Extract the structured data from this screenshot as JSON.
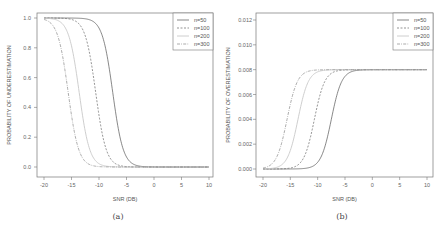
{
  "chart_data": [
    {
      "id": "a",
      "type": "line",
      "caption": "(a)",
      "title": "",
      "xlabel": "SNR (DB)",
      "ylabel": "PROBABILITY OF UNDERESTIMATION",
      "xlim": [
        -20,
        10
      ],
      "ylim": [
        0,
        1
      ],
      "xticks": [
        -20,
        -15,
        -10,
        -5,
        0,
        5,
        10
      ],
      "xtick_labels": [
        "-20",
        "-15",
        "-10",
        "-5",
        "0",
        "5",
        "10"
      ],
      "yticks": [
        0.0,
        0.2,
        0.4,
        0.6,
        0.8,
        1.0
      ],
      "ytick_labels": [
        "0.0",
        "0.2",
        "0.4",
        "0.6",
        "0.8",
        "1.0"
      ],
      "grid": false,
      "legend_position": "top-right",
      "x": [
        -20,
        -18,
        -16,
        -14,
        -12,
        -10,
        -8,
        -6,
        -4,
        -2,
        0,
        5,
        10
      ],
      "series": [
        {
          "name": "n=50",
          "style": "solid",
          "values": [
            1.0,
            1.0,
            1.0,
            1.0,
            0.99,
            0.95,
            0.6,
            0.1,
            0.01,
            0.0,
            0.0,
            0.0,
            0.0
          ]
        },
        {
          "name": "n=100",
          "style": "dashed",
          "values": [
            1.0,
            1.0,
            0.99,
            0.95,
            0.8,
            0.35,
            0.05,
            0.0,
            0.0,
            0.0,
            0.0,
            0.0,
            0.0
          ]
        },
        {
          "name": "n=200",
          "style": "dotted",
          "values": [
            1.0,
            0.97,
            0.88,
            0.6,
            0.15,
            0.02,
            0.0,
            0.0,
            0.0,
            0.0,
            0.0,
            0.0,
            0.0
          ]
        },
        {
          "name": "n=300",
          "style": "dashdot",
          "values": [
            0.98,
            0.9,
            0.6,
            0.2,
            0.03,
            0.0,
            0.0,
            0.0,
            0.0,
            0.0,
            0.0,
            0.0,
            0.0
          ]
        }
      ],
      "curve_params": [
        {
          "name": "n=50",
          "mid": -7.5,
          "k": 1.05,
          "top": 1.0
        },
        {
          "name": "n=100",
          "mid": -10.6,
          "k": 1.05,
          "top": 1.0
        },
        {
          "name": "n=200",
          "mid": -13.6,
          "k": 1.05,
          "top": 1.0
        },
        {
          "name": "n=300",
          "mid": -15.6,
          "k": 1.05,
          "top": 1.0
        }
      ]
    },
    {
      "id": "b",
      "type": "line",
      "caption": "(b)",
      "title": "",
      "xlabel": "SNR (DB)",
      "ylabel": "PROBABILITY OF OVERESTIMATION",
      "xlim": [
        -20,
        10
      ],
      "ylim": [
        0,
        0.012
      ],
      "xticks": [
        -20,
        -15,
        -10,
        -5,
        0,
        5,
        10
      ],
      "xtick_labels": [
        "-20",
        "-15",
        "-10",
        "-5",
        "0",
        "5",
        "10"
      ],
      "yticks": [
        0.0,
        0.002,
        0.004,
        0.006,
        0.008,
        0.01,
        0.012
      ],
      "ytick_labels": [
        "0.000",
        "0.002",
        "0.004",
        "0.006",
        "0.008",
        "0.010",
        "0.012"
      ],
      "grid": false,
      "legend_position": "top-right",
      "x": [
        -20,
        -18,
        -16,
        -14,
        -12,
        -10,
        -8,
        -6,
        -4,
        -2,
        0,
        5,
        10
      ],
      "series": [
        {
          "name": "n=50",
          "style": "solid",
          "values": [
            0.0,
            0.0,
            0.0,
            0.0,
            0.0001,
            0.0004,
            0.0032,
            0.0072,
            0.0079,
            0.008,
            0.008,
            0.008,
            0.008
          ]
        },
        {
          "name": "n=100",
          "style": "dashed",
          "values": [
            0.0,
            0.0,
            0.0001,
            0.0004,
            0.0016,
            0.0052,
            0.0076,
            0.008,
            0.008,
            0.008,
            0.008,
            0.008,
            0.008
          ]
        },
        {
          "name": "n=200",
          "style": "dotted",
          "values": [
            0.0,
            0.0002,
            0.001,
            0.0032,
            0.0068,
            0.0078,
            0.008,
            0.008,
            0.008,
            0.008,
            0.008,
            0.008,
            0.008
          ]
        },
        {
          "name": "n=300",
          "style": "dashdot",
          "values": [
            0.0001,
            0.0007,
            0.0032,
            0.0064,
            0.0078,
            0.008,
            0.008,
            0.008,
            0.008,
            0.008,
            0.008,
            0.008,
            0.008
          ]
        }
      ],
      "curve_params": [
        {
          "name": "n=50",
          "mid": -7.5,
          "k": 1.05,
          "top": 0.008
        },
        {
          "name": "n=100",
          "mid": -10.6,
          "k": 1.05,
          "top": 0.008
        },
        {
          "name": "n=200",
          "mid": -13.6,
          "k": 1.05,
          "top": 0.008
        },
        {
          "name": "n=300",
          "mid": -15.6,
          "k": 1.05,
          "top": 0.008
        }
      ]
    }
  ],
  "colors": {
    "axis": "#777777",
    "n50": "#555555",
    "n100": "#666666",
    "n200": "#c8c8c8",
    "n300": "#888888"
  }
}
